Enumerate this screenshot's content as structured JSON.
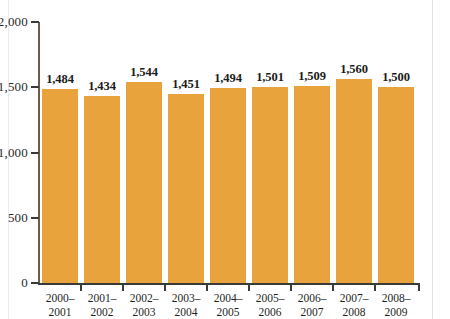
{
  "chart_data": {
    "type": "bar",
    "title": "",
    "subtitle": "",
    "xlabel": "",
    "ylabel": "",
    "ylim": [
      0,
      2000
    ],
    "yticks": [
      "0",
      "500",
      "1,000",
      "1,500",
      "2,000"
    ],
    "ytick_values": [
      0,
      500,
      1000,
      1500,
      2000
    ],
    "grid": false,
    "legend": null,
    "bar_color": "#e8a33d",
    "axis_color": "#3a3a38",
    "categories": [
      "2000–2001",
      "2001–2002",
      "2002–2003",
      "2003–2004",
      "2004–2005",
      "2005–2006",
      "2006–2007",
      "2007–2008",
      "2008–2009"
    ],
    "category_lines": [
      {
        "line1": "2000–",
        "line2": "2001"
      },
      {
        "line1": "2001–",
        "line2": "2002"
      },
      {
        "line1": "2002–",
        "line2": "2003"
      },
      {
        "line1": "2003–",
        "line2": "2004"
      },
      {
        "line1": "2004–",
        "line2": "2005"
      },
      {
        "line1": "2005–",
        "line2": "2006"
      },
      {
        "line1": "2006–",
        "line2": "2007"
      },
      {
        "line1": "2007–",
        "line2": "2008"
      },
      {
        "line1": "2008–",
        "line2": "2009"
      }
    ],
    "values": [
      1484,
      1434,
      1544,
      1451,
      1494,
      1501,
      1509,
      1560,
      1500
    ],
    "value_labels": [
      "1,484",
      "1,434",
      "1,544",
      "1,451",
      "1,494",
      "1,501",
      "1,509",
      "1,560",
      "1,500"
    ]
  }
}
